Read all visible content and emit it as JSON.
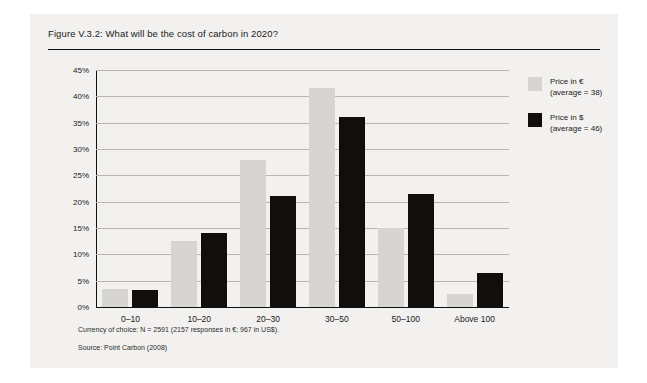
{
  "figure": {
    "title": "Figure V.3.2: What will be the cost of carbon in 2020?",
    "note_currency": "Currency of choice: N = 2591 (2157 responses in €; 967 in US$).",
    "note_source": "Source: Point Carbon (2008)"
  },
  "legend": [
    {
      "label_line1": "Price in €",
      "label_line2": "(average = 38)",
      "color": "#d6d5d2"
    },
    {
      "label_line1": "Price in $",
      "label_line2": "(average = 46)",
      "color": "#100f0d"
    }
  ],
  "chart_data": {
    "type": "bar",
    "title": "Figure V.3.2: What will be the cost of carbon in 2020?",
    "xlabel": "",
    "ylabel": "",
    "categories": [
      "0–10",
      "10–20",
      "20–30",
      "30–50",
      "50–100",
      "Above 100"
    ],
    "series": [
      {
        "name": "Price in € (average = 38)",
        "color": "#d6d5d2",
        "values": [
          3.5,
          12.5,
          28,
          41.5,
          15,
          2.5
        ]
      },
      {
        "name": "Price in $ (average = 46)",
        "color": "#100f0d",
        "values": [
          3.2,
          14,
          21,
          36,
          21.5,
          6.5
        ]
      }
    ],
    "ylim": [
      0,
      45
    ],
    "ytick_labels": [
      "0%",
      "5%",
      "10%",
      "15%",
      "20%",
      "25%",
      "30%",
      "35%",
      "40%",
      "45%"
    ],
    "ytick_values": [
      0,
      5,
      10,
      15,
      20,
      25,
      30,
      35,
      40,
      45
    ],
    "grid": true,
    "legend_position": "top-right-outside",
    "unit": "percent of responses"
  }
}
